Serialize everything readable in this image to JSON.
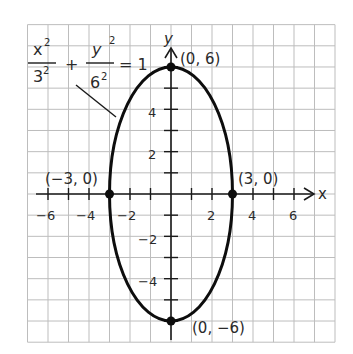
{
  "chart_data": {
    "type": "line",
    "title": "",
    "equation": {
      "x_num": "x²",
      "x_den": "3²",
      "plus": "+",
      "y_num": "y²",
      "y_den": "6²",
      "eq": "= 1"
    },
    "xlabel": "x",
    "ylabel": "y",
    "xlim": [
      -7,
      8
    ],
    "ylim": [
      -7,
      8
    ],
    "grid": true,
    "x_ticks": [
      "-6",
      "-4",
      "-2",
      "2",
      "4",
      "6"
    ],
    "y_ticks": [
      "4",
      "2",
      "-2",
      "-4"
    ],
    "curve": {
      "kind": "ellipse",
      "center": [
        0,
        0
      ],
      "a": 3,
      "b": 6
    },
    "points": [
      {
        "x": 0,
        "y": 6,
        "label": "(0, 6)"
      },
      {
        "x": 3,
        "y": 0,
        "label": "(3, 0)"
      },
      {
        "x": -3,
        "y": 0,
        "label": "(−3, 0)"
      },
      {
        "x": 0,
        "y": -6,
        "label": "(0, −6)"
      }
    ]
  },
  "labels": {
    "x_axis": "x",
    "y_axis": "y",
    "t_m6": "−6",
    "t_m4": "−4",
    "t_m2": "−2",
    "t_2": "2",
    "t_4": "4",
    "t_6": "6",
    "ty_4": "4",
    "ty_2": "2",
    "ty_m2": "−2",
    "ty_m4": "−4",
    "p_top": "(0, 6)",
    "p_right": "(3, 0)",
    "p_left": "(−3, 0)",
    "p_bottom": "(0, −6)",
    "eq_x_num": "x",
    "eq_x_den": "3",
    "eq_y_num": "y",
    "eq_y_den": "6",
    "eq_sup": "2",
    "eq_plus": "+",
    "eq_equals": "= 1"
  }
}
